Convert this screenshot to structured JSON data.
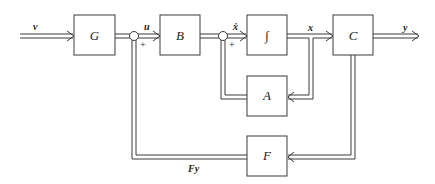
{
  "blocks": {
    "G": "G",
    "B": "B",
    "integrator": "∫",
    "C": "C",
    "A": "A",
    "F": "F"
  },
  "signals": {
    "input": "v",
    "control": "u",
    "state_derivative": "ẋ",
    "state": "x",
    "output": "y",
    "feedback": "Fy"
  },
  "summing_junctions": [
    {
      "name": "sum-1",
      "sign": "+"
    },
    {
      "name": "sum-2",
      "sign": "+"
    }
  ]
}
